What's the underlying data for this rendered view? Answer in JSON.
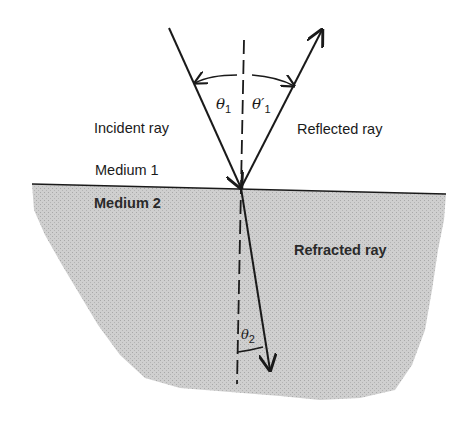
{
  "diagram": {
    "labels": {
      "incident_ray": "Incident ray",
      "reflected_ray": "Reflected ray",
      "refracted_ray": "Refracted ray",
      "medium_1": "Medium 1",
      "medium_2": "Medium 2"
    },
    "angles": {
      "theta1": {
        "symbol": "θ",
        "sub": "1",
        "prime": ""
      },
      "theta1_prime": {
        "symbol": "θ′",
        "sub": "1"
      },
      "theta2": {
        "symbol": "θ",
        "sub": "2"
      }
    },
    "colors": {
      "ink": "#1a1a1a",
      "medium2_fill": "#c9c9c9",
      "background": "#ffffff"
    },
    "geometry": {
      "hit_point": [
        241,
        188
      ],
      "incident_start": [
        169,
        28
      ],
      "reflected_end": [
        322,
        30
      ],
      "normal_top": [
        244,
        40
      ],
      "normal_bottom": [
        237,
        384
      ],
      "refracted_end": [
        270,
        370
      ],
      "interface": [
        [
          32,
          184
        ],
        [
          446,
          194
        ]
      ]
    }
  }
}
